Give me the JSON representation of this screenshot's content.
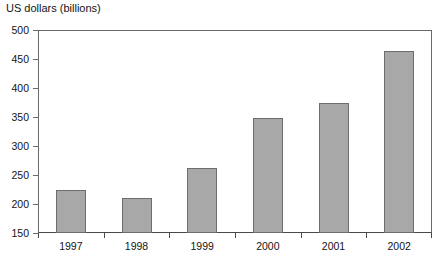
{
  "chart_data": {
    "type": "bar",
    "title": "US dollars (billions)",
    "xlabel": "",
    "ylabel": "US dollars (billions)",
    "categories": [
      "1997",
      "1998",
      "1999",
      "2000",
      "2001",
      "2002"
    ],
    "values": [
      225,
      210,
      262,
      349,
      375,
      463
    ],
    "ylim": [
      150,
      500
    ],
    "yticks": [
      150,
      200,
      250,
      300,
      350,
      400,
      450,
      500
    ],
    "ytick_labels": [
      "150",
      "200",
      "250",
      "300",
      "350",
      "400",
      "450",
      "500"
    ],
    "grid": false,
    "legend": null,
    "legend_position": "none",
    "bar_fill_color": "#a8a8a8",
    "bar_border_color": "#6e6e6e",
    "axis_color": "#4a4a4a",
    "background_color": "#ffffff"
  }
}
